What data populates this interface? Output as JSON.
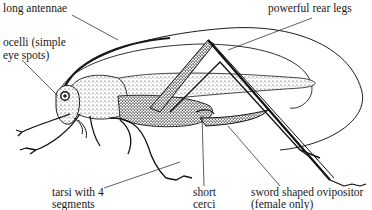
{
  "diagram": {
    "labels": {
      "long_antennae": "long antennae",
      "powerful_rear_legs": "powerful rear legs",
      "ocelli_line1": "ocelli (simple",
      "ocelli_line2": "eye spots)",
      "tarsi_line1": "tarsi with 4",
      "tarsi_line2": "segments",
      "cerci_line1": "short",
      "cerci_line2": "cerci",
      "ovipositor_line1": "sword shaped ovipositor",
      "ovipositor_line2": "(female only)"
    },
    "colors": {
      "ink": "#1a1a1a",
      "background": "#ffffff"
    }
  }
}
